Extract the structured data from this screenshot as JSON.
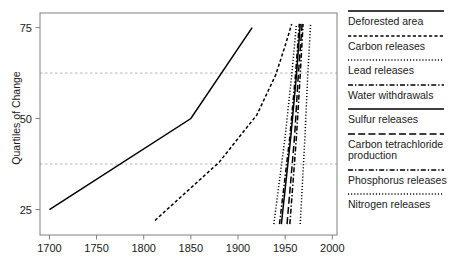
{
  "chart_data": {
    "type": "line",
    "title": "",
    "xlabel": "",
    "ylabel": "Quartiles of Change",
    "xlim": [
      1690,
      2005
    ],
    "ylim": [
      18,
      79
    ],
    "xticks": [
      1700,
      1750,
      1800,
      1850,
      1900,
      1950,
      2000
    ],
    "xtick_labels": [
      "1700",
      "1750",
      "1800",
      "1850",
      "1900",
      "1950",
      "2000"
    ],
    "yticks": [
      25,
      50,
      75
    ],
    "ytick_labels": [
      "25",
      "50",
      "75"
    ],
    "gridlines_y": [
      37.5,
      62.5
    ],
    "grid": "horizontal-dashed",
    "legend_position": "right",
    "series": [
      {
        "name": "Deforested area",
        "style": "solid",
        "points": [
          [
            1700,
            25
          ],
          [
            1850,
            50
          ],
          [
            1915,
            75
          ]
        ]
      },
      {
        "name": "Carbon releases",
        "style": "dashed",
        "points": [
          [
            1812,
            22
          ],
          [
            1880,
            38
          ],
          [
            1920,
            51
          ],
          [
            1940,
            62
          ],
          [
            1950,
            70
          ],
          [
            1957,
            76
          ]
        ]
      },
      {
        "name": "Lead releases",
        "style": "dotted",
        "points": [
          [
            1938,
            21
          ],
          [
            1950,
            45
          ],
          [
            1957,
            62
          ],
          [
            1962,
            76
          ]
        ]
      },
      {
        "name": "Water withdrawals",
        "style": "dashdot",
        "points": [
          [
            1944,
            21
          ],
          [
            1955,
            45
          ],
          [
            1961,
            62
          ],
          [
            1965,
            76
          ]
        ]
      },
      {
        "name": "Sulfur releases",
        "style": "solid",
        "points": [
          [
            1946,
            21
          ],
          [
            1956,
            45
          ],
          [
            1962,
            62
          ],
          [
            1966,
            76
          ]
        ]
      },
      {
        "name": "Carbon tetrachloride production",
        "style": "longdash",
        "points": [
          [
            1952,
            21
          ],
          [
            1960,
            45
          ],
          [
            1964,
            62
          ],
          [
            1968,
            76
          ]
        ]
      },
      {
        "name": "Phosphorus releases",
        "style": "dashdot",
        "points": [
          [
            1955,
            21
          ],
          [
            1962,
            45
          ],
          [
            1966,
            62
          ],
          [
            1969,
            76
          ]
        ]
      },
      {
        "name": "Nitrogen releases",
        "style": "dotted",
        "points": [
          [
            1966,
            21
          ],
          [
            1971,
            45
          ],
          [
            1974,
            62
          ],
          [
            1977,
            76
          ]
        ]
      }
    ]
  },
  "legend": {
    "entries": [
      {
        "label": "Deforested area",
        "style": "solid"
      },
      {
        "label": "Carbon releases",
        "style": "dashed"
      },
      {
        "label": "Lead releases",
        "style": "dotted"
      },
      {
        "label": "Water withdrawals",
        "style": "dashdot"
      },
      {
        "label": "Sulfur releases",
        "style": "solid"
      },
      {
        "label": "Carbon tetrachloride production",
        "style": "longdash"
      },
      {
        "label": "Phosphorus releases",
        "style": "dashdot"
      },
      {
        "label": "Nitrogen releases",
        "style": "dotted"
      }
    ]
  },
  "colors": {
    "line": "#000000",
    "axis": "#808080",
    "grid": "#9aa0c0",
    "text": "#1a1a1a"
  }
}
